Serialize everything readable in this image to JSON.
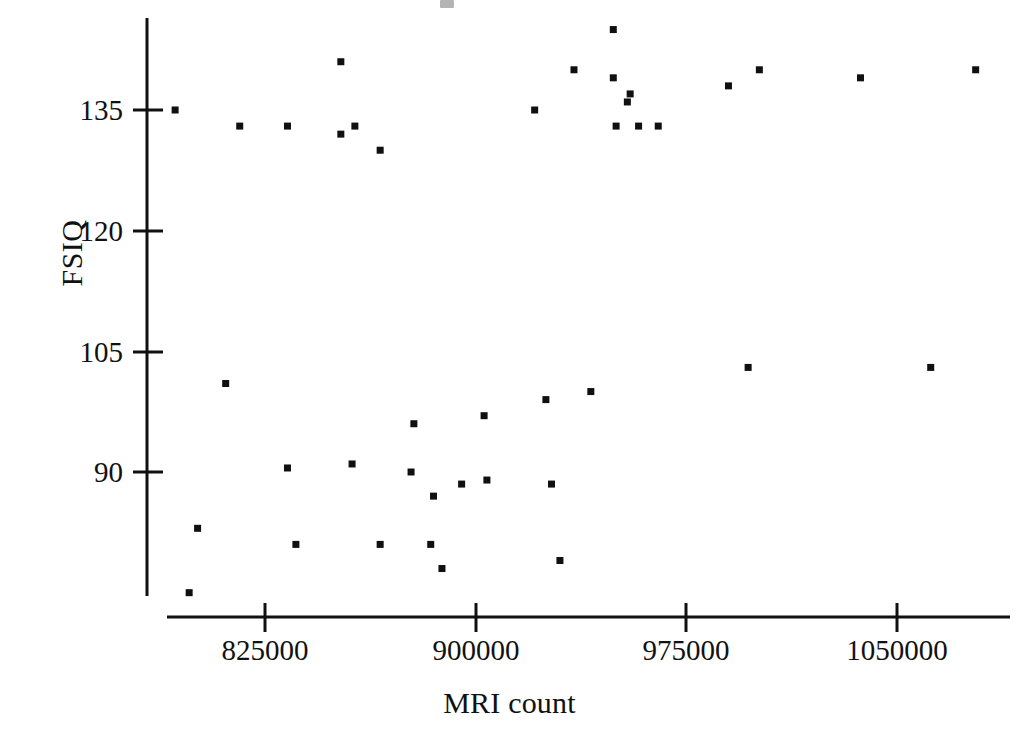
{
  "figure": {
    "background_color": "#ffffff",
    "ink_color": "#101010"
  },
  "axes": {
    "x_title": "MRI count",
    "y_title": "FSIQ",
    "x_ticks": [
      "825000",
      "900000",
      "975000",
      "1050000"
    ],
    "y_ticks": [
      "135",
      "120",
      "105",
      "90"
    ]
  },
  "chart_data": {
    "type": "scatter",
    "title": "",
    "xlabel": "MRI count",
    "ylabel": "FSIQ",
    "xlim": [
      795000,
      1100000
    ],
    "ylim": [
      74,
      146
    ],
    "xticks": [
      825000,
      900000,
      975000,
      1050000
    ],
    "yticks": [
      90,
      105,
      120,
      135
    ],
    "grid": false,
    "legend": null,
    "marker": "square",
    "marker_color": "#101010",
    "marker_size_px": 7,
    "n_points": 40,
    "points": [
      {
        "x": 793000,
        "y": 135
      },
      {
        "x": 801000,
        "y": 83
      },
      {
        "x": 798000,
        "y": 75
      },
      {
        "x": 811000,
        "y": 101
      },
      {
        "x": 816000,
        "y": 133
      },
      {
        "x": 833000,
        "y": 90.5
      },
      {
        "x": 836000,
        "y": 81
      },
      {
        "x": 833000,
        "y": 133
      },
      {
        "x": 852000,
        "y": 141
      },
      {
        "x": 852000,
        "y": 132
      },
      {
        "x": 857000,
        "y": 133
      },
      {
        "x": 856000,
        "y": 91
      },
      {
        "x": 866000,
        "y": 81
      },
      {
        "x": 866000,
        "y": 130
      },
      {
        "x": 878000,
        "y": 96
      },
      {
        "x": 877000,
        "y": 90
      },
      {
        "x": 885000,
        "y": 87
      },
      {
        "x": 884000,
        "y": 81
      },
      {
        "x": 888000,
        "y": 78
      },
      {
        "x": 895000,
        "y": 88.5
      },
      {
        "x": 903000,
        "y": 97
      },
      {
        "x": 904000,
        "y": 89
      },
      {
        "x": 921000,
        "y": 135
      },
      {
        "x": 925000,
        "y": 99
      },
      {
        "x": 927000,
        "y": 88.5
      },
      {
        "x": 930000,
        "y": 79
      },
      {
        "x": 935000,
        "y": 140
      },
      {
        "x": 941000,
        "y": 100
      },
      {
        "x": 949000,
        "y": 145
      },
      {
        "x": 949000,
        "y": 139
      },
      {
        "x": 950000,
        "y": 133
      },
      {
        "x": 955000,
        "y": 137
      },
      {
        "x": 954000,
        "y": 136
      },
      {
        "x": 958000,
        "y": 133
      },
      {
        "x": 965000,
        "y": 133
      },
      {
        "x": 997000,
        "y": 103
      },
      {
        "x": 990000,
        "y": 138
      },
      {
        "x": 1001000,
        "y": 140
      },
      {
        "x": 1062000,
        "y": 103
      },
      {
        "x": 1037000,
        "y": 139
      },
      {
        "x": 1078000,
        "y": 140
      }
    ]
  }
}
